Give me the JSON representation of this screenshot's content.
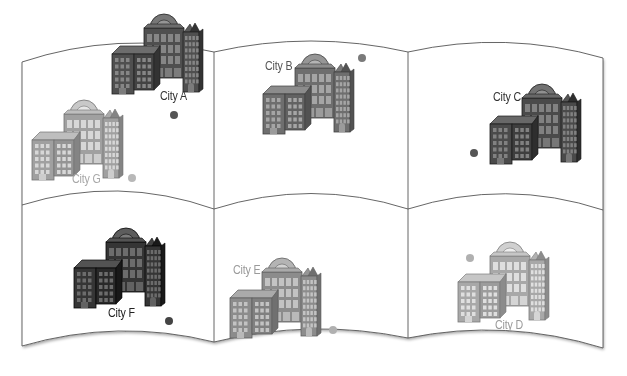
{
  "diagram": {
    "type": "map-panels",
    "rows": 2,
    "columns": 3,
    "panel_stroke": "#555555",
    "cities": [
      {
        "id": "A",
        "label": "City A",
        "tone": "dark",
        "fill": "#4f4f4f",
        "text_color": "#333333",
        "dot_color": "#555555",
        "panel": "top-left",
        "label_pos": [
          160,
          88
        ],
        "dot_pos": [
          170,
          111
        ],
        "building_pos": [
          110,
          10
        ]
      },
      {
        "id": "B",
        "label": "City B",
        "tone": "medium",
        "fill": "#6e6e6e",
        "text_color": "#555555",
        "dot_color": "#7a7a7a",
        "panel": "top-middle",
        "label_pos": [
          265,
          58
        ],
        "dot_pos": [
          358,
          54
        ],
        "building_pos": [
          261,
          50
        ]
      },
      {
        "id": "C",
        "label": "City C",
        "tone": "dark",
        "fill": "#4a4a4a",
        "text_color": "#333333",
        "dot_color": "#555555",
        "panel": "top-right",
        "label_pos": [
          493,
          89
        ],
        "dot_pos": [
          470,
          149
        ],
        "building_pos": [
          488,
          80
        ]
      },
      {
        "id": "D",
        "label": "City D",
        "tone": "light",
        "fill": "#a8a8a8",
        "text_color": "#9a9a9a",
        "dot_color": "#b0b0b0",
        "panel": "bottom-right",
        "label_pos": [
          495,
          317
        ],
        "dot_pos": [
          466,
          254
        ],
        "building_pos": [
          456,
          238
        ]
      },
      {
        "id": "E",
        "label": "City E",
        "tone": "medium",
        "fill": "#8c8c8c",
        "text_color": "#9a9a9a",
        "dot_color": "#b0b0b0",
        "panel": "bottom-middle",
        "label_pos": [
          233,
          262
        ],
        "dot_pos": [
          329,
          326
        ],
        "building_pos": [
          228,
          254
        ]
      },
      {
        "id": "F",
        "label": "City F",
        "tone": "darkest",
        "fill": "#353535",
        "text_color": "#222222",
        "dot_color": "#444444",
        "panel": "bottom-left",
        "label_pos": [
          108,
          305
        ],
        "dot_pos": [
          165,
          317
        ],
        "building_pos": [
          72,
          224
        ]
      },
      {
        "id": "G",
        "label": "City G",
        "tone": "light",
        "fill": "#a0a0a0",
        "text_color": "#a8a8a8",
        "dot_color": "#b8b8b8",
        "panel": "top-left",
        "label_pos": [
          72,
          171
        ],
        "dot_pos": [
          128,
          174
        ],
        "building_pos": [
          30,
          96
        ]
      }
    ]
  }
}
